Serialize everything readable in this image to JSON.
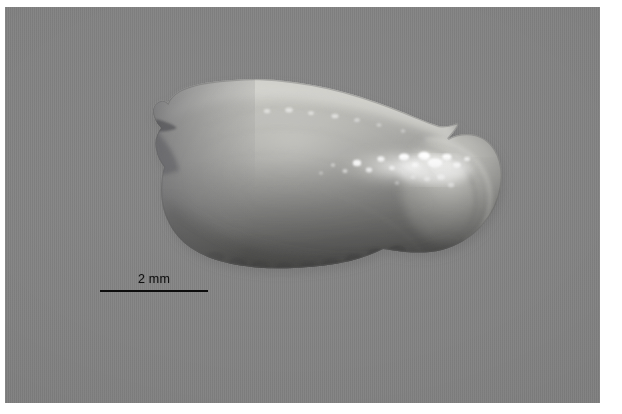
{
  "figure": {
    "caption_text": "",
    "domain_subject": "otolith specimen photograph",
    "canvas": {
      "width_px": 622,
      "height_px": 414
    },
    "background_color": "#ffffff"
  },
  "photo_plate": {
    "name": "photographic-plate",
    "backdrop_color": "#818181",
    "left_px": 5,
    "top_px": 7,
    "width_px": 595,
    "height_px": 396
  },
  "specimen": {
    "label": "otolith",
    "description": "translucent sagittal otolith, lateral view",
    "body_fill_color": "#8e8e8c",
    "bright_margin_color": "#c9c9c5",
    "dark_ventral_color": "#5c5c5a",
    "highlight_color": "#f6f6f2",
    "bounds_px": {
      "left": 155,
      "top": 78,
      "right": 505,
      "bottom": 272
    },
    "features": [
      "dorsal margin pale and smooth",
      "anterior excisura notch on left edge",
      "bright specular sulcus highlights on right half",
      "crenulated darker ventral margin",
      "rounded posterior lobe on right"
    ]
  },
  "scale_bar": {
    "name": "scale-bar",
    "label": "2 mm",
    "value": 2,
    "unit": "mm",
    "line_color": "#0d0d0d",
    "line_length_px": 108,
    "line_left_px": 95,
    "line_top_px": 290,
    "label_center_x_px": 149,
    "label_baseline_y_px": 284
  }
}
